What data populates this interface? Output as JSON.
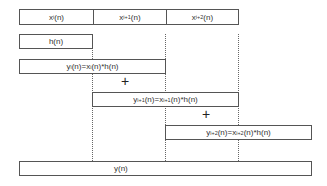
{
  "diagram": {
    "type": "overlap-add convolution",
    "input_segments": [
      {
        "label": "x",
        "sub": "i",
        "suffix": "(n)"
      },
      {
        "label": "x",
        "sub": "i+1",
        "suffix": "(n)"
      },
      {
        "label": "x",
        "sub": "i+2",
        "suffix": "(n)"
      }
    ],
    "filter": {
      "label": "h(n)"
    },
    "partial_outputs": [
      {
        "y": "y",
        "ysub": "i",
        "mid": "(n)=x",
        "xsub": "i",
        "end": "(n)*h(n)"
      },
      {
        "y": "y",
        "ysub": "i+1",
        "mid": "(n)=x",
        "xsub": "i+1",
        "end": "(n)*h(n)"
      },
      {
        "y": "y",
        "ysub": "i+2",
        "mid": "(n)=x",
        "xsub": "i+2",
        "end": "(n)*h(n)"
      }
    ],
    "operators": [
      "+",
      "+"
    ],
    "output": {
      "label": "y(n)"
    }
  }
}
